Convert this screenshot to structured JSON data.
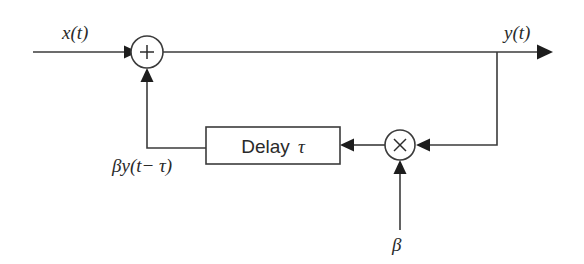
{
  "diagram": {
    "type": "signal-flow-block-diagram",
    "background_color": "#ffffff",
    "line_color": "#3b3b3b",
    "text_color": "#2a2a2a",
    "labels": {
      "input_signal": "x(t)",
      "output_signal": "y(t)",
      "feedback_signal": "βy(t− τ)",
      "gain_input": "β"
    },
    "blocks": [
      {
        "id": "summer",
        "name": "summing-junction",
        "shape": "circle",
        "operator": "+",
        "cx": 147,
        "cy": 52,
        "r": 16
      },
      {
        "id": "delay",
        "name": "delay-block",
        "shape": "rectangle",
        "label": "Delay τ",
        "label_text": "Delay",
        "label_symbol": "τ",
        "x": 206,
        "y": 127,
        "width": 134,
        "height": 37
      },
      {
        "id": "multiplier",
        "name": "multiplier-junction",
        "shape": "circle",
        "operator": "×",
        "cx": 400,
        "cy": 145,
        "r": 15
      }
    ],
    "connections": [
      {
        "from": "input",
        "to": "summer",
        "label": "x(t)"
      },
      {
        "from": "summer",
        "to": "output",
        "label": "y(t)"
      },
      {
        "from": "output-branch",
        "to": "multiplier",
        "label": ""
      },
      {
        "from": "gain",
        "to": "multiplier",
        "label": "β"
      },
      {
        "from": "multiplier",
        "to": "delay",
        "label": ""
      },
      {
        "from": "delay",
        "to": "summer",
        "label": "βy(t− τ)"
      }
    ]
  }
}
